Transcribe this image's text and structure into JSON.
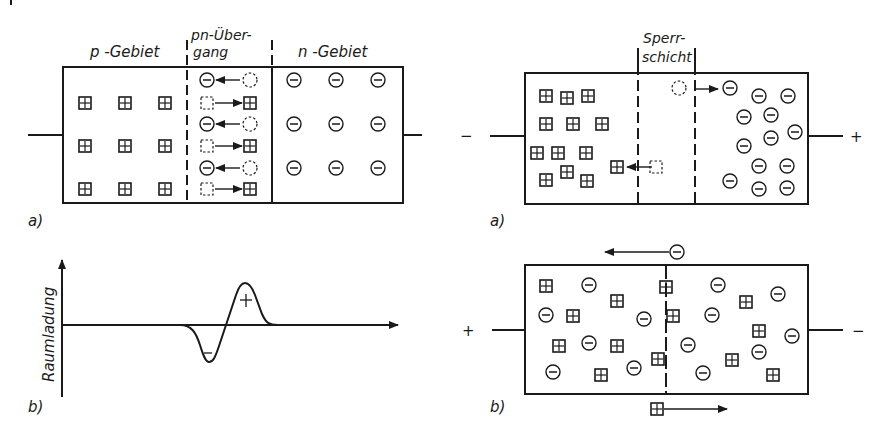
{
  "figure_a_left": {
    "label_p_region": "p -Gebiet",
    "label_junction_line1": "pn-Über-",
    "label_junction_line2": "gang",
    "label_n_region": "n -Gebiet",
    "caption": "a)"
  },
  "figure_b_left": {
    "y_axis_label": "Raumladung",
    "neg_sign": "−",
    "pos_sign": "+",
    "caption": "b)"
  },
  "figure_a_right": {
    "label_line1": "Sperr-",
    "label_line2": "schicht",
    "terminal_left": "−",
    "terminal_right": "+",
    "caption": "a)"
  },
  "figure_b_right": {
    "terminal_left": "+",
    "terminal_right": "−",
    "caption": "b)"
  },
  "colors": {
    "ink": "#1a1a1a",
    "background": "#ffffff"
  }
}
